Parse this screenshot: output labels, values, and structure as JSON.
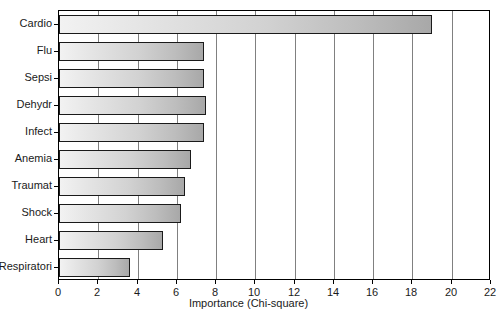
{
  "chart_data": {
    "type": "bar",
    "orientation": "horizontal",
    "title": "",
    "xlabel": "Importance (Chi-square)",
    "ylabel": "",
    "xlim": [
      0,
      22
    ],
    "ylim": [
      0,
      10
    ],
    "grid": true,
    "legend": null,
    "xticks": [
      "0",
      "2",
      "4",
      "6",
      "8",
      "10",
      "12",
      "14",
      "16",
      "18",
      "20",
      "22"
    ],
    "xtick_values": [
      0,
      2,
      4,
      6,
      8,
      10,
      12,
      14,
      16,
      18,
      20,
      22
    ],
    "categories": [
      "Cardio",
      "Flu",
      "Sepsi",
      "Dehydr",
      "Infect",
      "Anemia",
      "Traumat",
      "Shock",
      "Heart",
      "Respiratori"
    ],
    "values": [
      19.0,
      7.4,
      7.4,
      7.5,
      7.4,
      6.7,
      6.4,
      6.2,
      5.3,
      3.6
    ],
    "bar_fill_start": "#f2f2f2",
    "bar_fill_end": "#a8a8a8",
    "bar_edge_color": "#1a1a1a",
    "gridline_color": "#808080",
    "axis_color": "#000000",
    "background": "#ffffff"
  }
}
